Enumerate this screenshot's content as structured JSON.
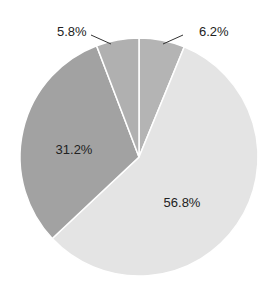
{
  "chart_data": {
    "type": "pie",
    "title": "",
    "slices": [
      {
        "label": "6.2%",
        "value": 6.2,
        "color": "#b4b4b4",
        "label_outside": true
      },
      {
        "label": "56.8%",
        "value": 56.8,
        "color": "#e4e4e4",
        "label_outside": false
      },
      {
        "label": "31.2%",
        "value": 31.2,
        "color": "#a2a2a2",
        "label_outside": false
      },
      {
        "label": "5.8%",
        "value": 5.8,
        "color": "#b0b0b0",
        "label_outside": true
      }
    ],
    "start_angle_deg": 0,
    "direction": "clockwise",
    "legend": "none"
  },
  "labels": {
    "s0": "6.2%",
    "s1": "56.8%",
    "s2": "31.2%",
    "s3": "5.8%"
  }
}
